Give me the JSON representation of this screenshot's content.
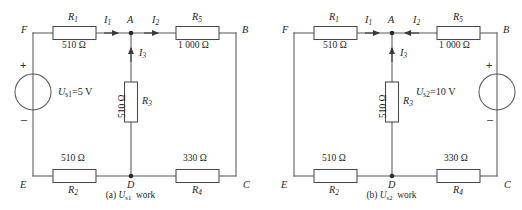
{
  "figure": {
    "title_visible": false,
    "stroke_color": "#595959",
    "text_color": "#1d1d1d",
    "background": "#ffffff"
  },
  "panels": [
    {
      "id": "panel-a",
      "caption_prefix": "(a)",
      "caption_source": "U",
      "caption_source_sub": "s1",
      "caption_suffix": "work",
      "nodes": [
        {
          "name": "F",
          "label": "F"
        },
        {
          "name": "A",
          "label": "A"
        },
        {
          "name": "B",
          "label": "B"
        },
        {
          "name": "C",
          "label": "C"
        },
        {
          "name": "D",
          "label": "D"
        },
        {
          "name": "E",
          "label": "E"
        }
      ],
      "resistors": [
        {
          "name": "R1",
          "label": "R",
          "sub": "1",
          "value": "510 Ω",
          "orientation": "horizontal"
        },
        {
          "name": "R5",
          "label": "R",
          "sub": "5",
          "value": "1 000 Ω",
          "orientation": "horizontal"
        },
        {
          "name": "R3",
          "label": "R",
          "sub": "3",
          "value": "510 Ω",
          "orientation": "vertical"
        },
        {
          "name": "R2",
          "label": "R",
          "sub": "2",
          "value": "510 Ω",
          "orientation": "horizontal"
        },
        {
          "name": "R4",
          "label": "R",
          "sub": "4",
          "value": "330 Ω",
          "orientation": "horizontal"
        }
      ],
      "currents": [
        {
          "name": "I1",
          "label": "I",
          "sub": "1",
          "direction": "right"
        },
        {
          "name": "I2",
          "label": "I",
          "sub": "2",
          "direction": "right"
        },
        {
          "name": "I3",
          "label": "I",
          "sub": "3",
          "direction": "up"
        }
      ],
      "source": {
        "name": "Us1",
        "symbol": "U",
        "sub": "s1",
        "equation": "=5 V",
        "full_label": "U s1 =5 V",
        "plus": "+",
        "minus": "–",
        "position": "left-branch-EF"
      }
    },
    {
      "id": "panel-b",
      "caption_prefix": "(b)",
      "caption_source": "U",
      "caption_source_sub": "s2",
      "caption_suffix": "work",
      "nodes": [
        {
          "name": "F",
          "label": "F"
        },
        {
          "name": "A",
          "label": "A"
        },
        {
          "name": "B",
          "label": "B"
        },
        {
          "name": "C",
          "label": "C"
        },
        {
          "name": "D",
          "label": "D"
        },
        {
          "name": "E",
          "label": "E"
        }
      ],
      "resistors": [
        {
          "name": "R1",
          "label": "R",
          "sub": "1",
          "value": "510 Ω",
          "orientation": "horizontal"
        },
        {
          "name": "R5",
          "label": "R",
          "sub": "5",
          "value": "1 000 Ω",
          "orientation": "horizontal"
        },
        {
          "name": "R3",
          "label": "R",
          "sub": "3",
          "value": "510 Ω",
          "orientation": "vertical"
        },
        {
          "name": "R2",
          "label": "R",
          "sub": "2",
          "value": "510 Ω",
          "orientation": "horizontal"
        },
        {
          "name": "R4",
          "label": "R",
          "sub": "4",
          "value": "330 Ω",
          "orientation": "horizontal"
        }
      ],
      "currents": [
        {
          "name": "I1",
          "label": "I",
          "sub": "1",
          "direction": "right"
        },
        {
          "name": "I2",
          "label": "I",
          "sub": "2",
          "direction": "left"
        },
        {
          "name": "I3",
          "label": "I",
          "sub": "3",
          "direction": "up"
        }
      ],
      "source": {
        "name": "Us2",
        "symbol": "U",
        "sub": "s2",
        "equation": "=10 V",
        "full_label": "U s2 =10 V",
        "plus": "+",
        "minus": "–",
        "position": "right-branch-BC"
      }
    }
  ]
}
